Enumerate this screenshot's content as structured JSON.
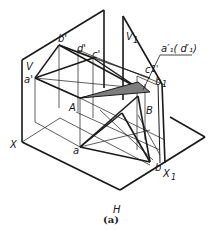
{
  "figure": {
    "caption": "(a)",
    "planes": {
      "v": "V",
      "h": "H",
      "v1": "V",
      "v1_sub": "1"
    },
    "axes": {
      "x": "X",
      "x1": "X",
      "x1_sub": "1"
    },
    "points_v": {
      "a": "a'",
      "b": "b'",
      "c": "c'",
      "d": "d'"
    },
    "points_h": {
      "a": "a",
      "b": "b"
    },
    "points_space": {
      "A": "A",
      "B": "B"
    },
    "points_v1": {
      "c1": "c",
      "c1_mark": "1'",
      "b1": "b",
      "b1_sub": "1",
      "a1d1_callout": "a′₁( d′₁)"
    },
    "colors": {
      "line": "#1a1a1a",
      "shade": "#7d7d7d",
      "background": "#ffffff"
    }
  }
}
